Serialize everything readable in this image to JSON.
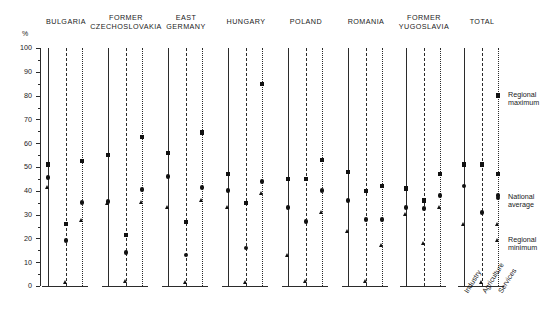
{
  "chart_data": {
    "type": "scatter",
    "title": "",
    "ylabel": "%",
    "ylim": [
      0,
      100
    ],
    "yticks": [
      0,
      10,
      20,
      30,
      40,
      50,
      60,
      70,
      80,
      90,
      100
    ],
    "grid": false,
    "legend_position": "right",
    "categories": [
      "Industry",
      "Agriculture",
      "Services"
    ],
    "series": [
      {
        "name": "Regional maximum",
        "marker": "square"
      },
      {
        "name": "National average",
        "marker": "circle"
      },
      {
        "name": "Regional minimum",
        "marker": "triangle"
      }
    ],
    "panels": [
      {
        "name": "BULGARIA",
        "label": "BULGARIA",
        "values": {
          "Industry": {
            "Regional maximum": 51,
            "National average": 45.5,
            "Regional minimum": 41.5
          },
          "Agriculture": {
            "Regional maximum": 26,
            "National average": 19,
            "Regional minimum": 1.5
          },
          "Services": {
            "Regional maximum": 52.5,
            "National average": 35,
            "Regional minimum": 27.5
          }
        }
      },
      {
        "name": "FORMER CZECHOSLOVAKIA",
        "label": "FORMER\nCZECHOSLOVAKIA",
        "values": {
          "Industry": {
            "Regional maximum": 55,
            "National average": 35.5,
            "Regional minimum": 34.5
          },
          "Agriculture": {
            "Regional maximum": 21.5,
            "National average": 14,
            "Regional minimum": 2
          },
          "Services": {
            "Regional maximum": 62.5,
            "National average": 40.5,
            "Regional minimum": 35
          }
        }
      },
      {
        "name": "EAST GERMANY",
        "label": "EAST\nGERMANY",
        "values": {
          "Industry": {
            "Regional maximum": 56,
            "National average": 46,
            "Regional minimum": 33
          },
          "Agriculture": {
            "Regional maximum": 27,
            "National average": 13,
            "Regional minimum": 1.5
          },
          "Services": {
            "Regional maximum": 64.5,
            "National average": 41.5,
            "Regional minimum": 36
          }
        }
      },
      {
        "name": "HUNGARY",
        "label": "HUNGARY",
        "values": {
          "Industry": {
            "Regional maximum": 47,
            "National average": 40,
            "Regional minimum": 33
          },
          "Agriculture": {
            "Regional maximum": 35,
            "National average": 16,
            "Regional minimum": 1.5
          },
          "Services": {
            "Regional maximum": 85,
            "National average": 44,
            "Regional minimum": 39
          }
        }
      },
      {
        "name": "POLAND",
        "label": "POLAND",
        "values": {
          "Industry": {
            "Regional maximum": 45,
            "National average": 33,
            "Regional minimum": 13
          },
          "Agriculture": {
            "Regional maximum": 45,
            "National average": 27,
            "Regional minimum": 2
          },
          "Services": {
            "Regional maximum": 53,
            "National average": 40,
            "Regional minimum": 31
          }
        }
      },
      {
        "name": "ROMANIA",
        "label": "ROMANIA",
        "values": {
          "Industry": {
            "Regional maximum": 48,
            "National average": 36,
            "Regional minimum": 23
          },
          "Agriculture": {
            "Regional maximum": 40,
            "National average": 28,
            "Regional minimum": 2
          },
          "Services": {
            "Regional maximum": 42,
            "National average": 28,
            "Regional minimum": 17
          }
        }
      },
      {
        "name": "FORMER YUGOSLAVIA",
        "label": "FORMER\nYUGOSLAVIA",
        "values": {
          "Industry": {
            "Regional maximum": 41,
            "National average": 33,
            "Regional minimum": 30
          },
          "Agriculture": {
            "Regional maximum": 36,
            "National average": 32.5,
            "Regional minimum": 18
          },
          "Services": {
            "Regional maximum": 47,
            "National average": 38,
            "Regional minimum": 33
          }
        }
      },
      {
        "name": "TOTAL",
        "label": "TOTAL",
        "values": {
          "Industry": {
            "Regional maximum": 51,
            "National average": 42,
            "Regional minimum": 26
          },
          "Agriculture": {
            "Regional maximum": 51,
            "National average": 31,
            "Regional minimum": 1.5
          },
          "Services": {
            "Regional maximum": 47,
            "National average": 38,
            "Regional minimum": 26
          }
        }
      }
    ],
    "annotations": [
      {
        "name": "Regional maximum",
        "text": "Regional\nmaximum",
        "value": 80,
        "marker": "square"
      },
      {
        "name": "National average",
        "text": "National\naverage",
        "value": 37,
        "marker": "circle"
      },
      {
        "name": "Regional minimum",
        "text": "Regional\nminimum",
        "value": 19,
        "marker": "triangle"
      }
    ]
  }
}
